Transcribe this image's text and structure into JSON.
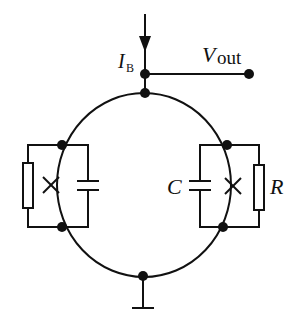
{
  "diagram": {
    "type": "circuit-schematic",
    "colors": {
      "stroke": "#111111",
      "background": "#ffffff"
    },
    "labels": {
      "bias_current_main": "I",
      "bias_current_sub": "B",
      "output_main": "V",
      "output_sub": "out",
      "capacitance": "C",
      "resistance": "R"
    },
    "components": [
      {
        "id": "loop",
        "kind": "superconducting-ring"
      },
      {
        "id": "jj-left",
        "kind": "josephson-junction",
        "shunts": [
          "resistor-left",
          "capacitor-left"
        ]
      },
      {
        "id": "jj-right",
        "kind": "josephson-junction",
        "shunts": [
          "capacitor-right",
          "resistor-right"
        ]
      },
      {
        "id": "bias-input",
        "kind": "current-arrow",
        "label": "I_B"
      },
      {
        "id": "output-terminal",
        "kind": "terminal",
        "label": "V_out"
      },
      {
        "id": "ground",
        "kind": "ground"
      }
    ]
  }
}
